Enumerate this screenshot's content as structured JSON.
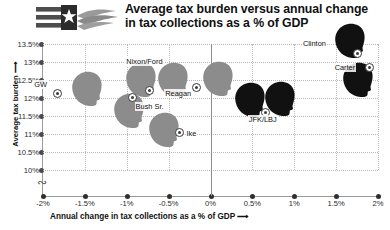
{
  "header": {
    "title_line1": "Average tax burden versus annual change",
    "title_line2": "in tax collections as a % of GDP",
    "logo_name": "flag-hand-logo"
  },
  "chart_data": {
    "type": "scatter",
    "title": "Average tax burden versus annual change in tax collections as a % of GDP",
    "xlabel": "Annual change in tax collections as a % of GDP ⟶",
    "ylabel": "Average tax burden ⟶",
    "xlim": [
      -2,
      2
    ],
    "ylim": [
      10,
      13.5
    ],
    "y_axis_break": true,
    "grid": true,
    "legend": "none",
    "x_ticks": [
      "-2%",
      "-1.5%",
      "-1%",
      "-0.5%",
      "0%",
      "0.5%",
      "1%",
      "1.5%",
      "2%"
    ],
    "x_tick_values": [
      -2,
      -1.5,
      -1,
      -0.5,
      0,
      0.5,
      1,
      1.5,
      2
    ],
    "y_ticks": [
      "13.5%",
      "13%",
      "12.5%",
      "12%",
      "11.5%",
      "11%",
      "10.5%",
      "10%"
    ],
    "y_tick_values": [
      13.5,
      13,
      12.5,
      12,
      11.5,
      11,
      10.5,
      10
    ],
    "series": [
      {
        "name": "Republican",
        "color": "#8c8c8c",
        "points": [
          {
            "label": "GW",
            "x": -1.83,
            "y": 12.13,
            "party": "republican"
          },
          {
            "label": "Nixon/Ford",
            "x": -0.73,
            "y": 12.22,
            "party": "republican"
          },
          {
            "label": "Bush Sr.",
            "x": -0.93,
            "y": 12.02,
            "party": "republican"
          },
          {
            "label": "Reagan",
            "x": -0.17,
            "y": 12.3,
            "party": "republican"
          },
          {
            "label": "Ike",
            "x": -0.37,
            "y": 11.05,
            "party": "republican"
          }
        ]
      },
      {
        "name": "Democrat",
        "color": "#111111",
        "points": [
          {
            "label": "Clinton",
            "x": 1.76,
            "y": 13.25,
            "party": "democrat"
          },
          {
            "label": "Carter",
            "x": 1.9,
            "y": 12.84,
            "party": "democrat"
          },
          {
            "label": "JFK/LBJ",
            "x": 0.66,
            "y": 11.6,
            "party": "democrat"
          }
        ]
      }
    ],
    "extra_heads": [
      {
        "for": "Nixon/Ford",
        "note": "second silhouette (Ford)"
      },
      {
        "for": "JFK/LBJ",
        "note": "second silhouette (LBJ)"
      }
    ]
  }
}
